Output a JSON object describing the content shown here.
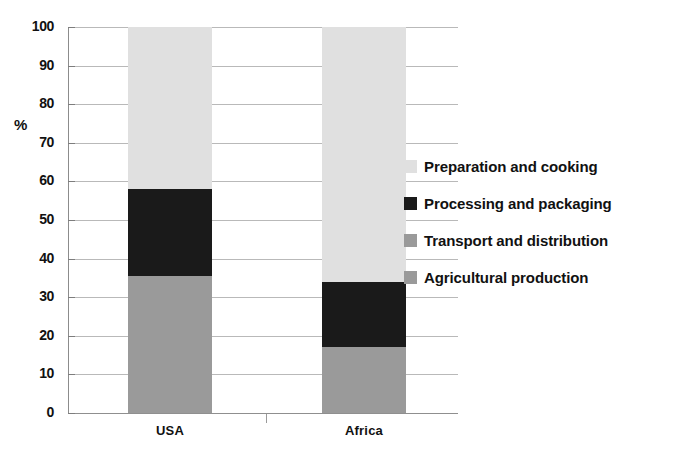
{
  "chart_data": {
    "type": "bar",
    "subtype": "stacked-bar",
    "title": "",
    "xlabel": "",
    "ylabel": "%",
    "ylim": [
      0,
      100
    ],
    "yticks": [
      0,
      10,
      20,
      30,
      40,
      50,
      60,
      70,
      80,
      90,
      100
    ],
    "grid": true,
    "legend_position": "right",
    "categories": [
      "USA",
      "Africa"
    ],
    "series": [
      {
        "name": "Preparation and cooking",
        "color": "#e0e0e0",
        "values": [
          42,
          66
        ]
      },
      {
        "name": "Processing and packaging",
        "color": "#1a1a1a",
        "values": [
          22.5,
          17
        ]
      },
      {
        "name": "Transport and distribution",
        "color": "#9a9a9a",
        "values": [
          0,
          0
        ]
      },
      {
        "name": "Agricultural production",
        "color": "#9a9a9a",
        "values": [
          35.5,
          17
        ]
      }
    ],
    "stack_boundaries": {
      "USA": [
        0,
        35.5,
        35.5,
        58,
        100
      ],
      "Africa": [
        0,
        17,
        17,
        34,
        100
      ]
    }
  },
  "axis": {
    "y_unit_label": "%",
    "tick_labels": [
      "100",
      "90",
      "80",
      "70",
      "60",
      "50",
      "40",
      "30",
      "20",
      "10",
      "0"
    ],
    "category_labels": [
      "USA",
      "Africa"
    ]
  },
  "legend": {
    "items": [
      {
        "label": "Preparation and cooking",
        "color": "#e0e0e0"
      },
      {
        "label": "Processing and packaging",
        "color": "#1a1a1a"
      },
      {
        "label": "Transport and distribution",
        "color": "#9a9a9a"
      },
      {
        "label": "Agricultural production",
        "color": "#9a9a9a"
      }
    ]
  }
}
